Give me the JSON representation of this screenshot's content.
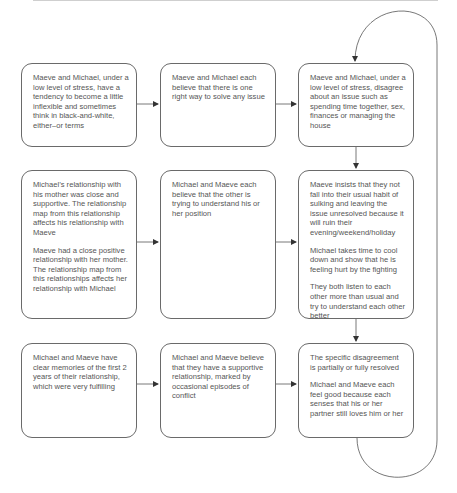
{
  "diagram": {
    "type": "flowchart",
    "columns": [
      "predisposing factors",
      "beliefs",
      "interaction sequence"
    ],
    "rows": [
      {
        "boxes": [
          {
            "id": "r1c1",
            "paragraphs": [
              "Maeve and Michael, under a low level of stress, have a tendency to become a little inflexible and sometimes think in black-and-white, either–or terms"
            ]
          },
          {
            "id": "r1c2",
            "paragraphs": [
              "Maeve and Michael each believe that there is one right way to solve any issue"
            ]
          },
          {
            "id": "r1c3",
            "paragraphs": [
              "Maeve and Michael, under a low level of stress, disagree about an issue such as spending time together, sex, finances or managing the house"
            ]
          }
        ]
      },
      {
        "boxes": [
          {
            "id": "r2c1",
            "paragraphs": [
              "Michael’s relationship with his mother was close and supportive. The relationship map from this relationship affects his relationship with Maeve",
              "Maeve had a close positive relationship with her mother. The relationship map from this relationships affects her relationship with Michael"
            ]
          },
          {
            "id": "r2c2",
            "paragraphs": [
              "Michael and Maeve each believe that the other is trying to understand his or her position"
            ]
          },
          {
            "id": "r2c3",
            "paragraphs": [
              "Maeve insists that they not fall into their usual habit of sulking and leaving the issue unresolved because it will ruin their evening/weekend/holiday",
              "Michael takes time to cool down and show that he is feeling hurt by the fighting",
              "They both listen to each other more than usual and try to understand each other better"
            ]
          }
        ]
      },
      {
        "boxes": [
          {
            "id": "r3c1",
            "paragraphs": [
              "Michael and Maeve have clear memories of the first 2 years of their relationship, which were very fulfilling"
            ]
          },
          {
            "id": "r3c2",
            "paragraphs": [
              "Michael and Maeve believe that they have a supportive relationship, marked by occasional episodes of conflict"
            ]
          },
          {
            "id": "r3c3",
            "paragraphs": [
              "The specific disagreement is partially or fully resolved",
              "Michael and Maeve each feel good because each senses that his or her partner still loves him or her"
            ]
          }
        ]
      }
    ],
    "edges": [
      {
        "from": "r1c1",
        "to": "r1c2"
      },
      {
        "from": "r1c2",
        "to": "r1c3"
      },
      {
        "from": "r2c1",
        "to": "r2c2"
      },
      {
        "from": "r2c2",
        "to": "r2c3"
      },
      {
        "from": "r3c1",
        "to": "r3c2"
      },
      {
        "from": "r3c2",
        "to": "r3c3"
      },
      {
        "from": "r1c3",
        "to": "r2c3"
      },
      {
        "from": "r2c3",
        "to": "r3c3"
      },
      {
        "from": "r3c3",
        "to": "r1c3",
        "style": "loop"
      }
    ],
    "colors": {
      "stroke": "#6a6a6a",
      "text": "#555555",
      "background": "#ffffff"
    }
  }
}
